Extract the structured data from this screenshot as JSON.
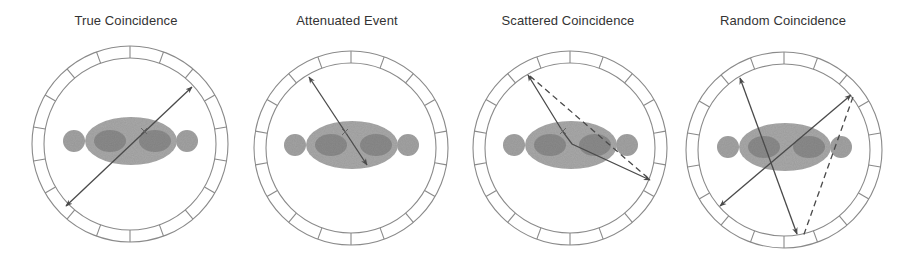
{
  "figure": {
    "colors": {
      "ring": "#8a8a8a",
      "line": "#4a4a4a",
      "torso": "#a9a9a9",
      "organ": "#8b8b8b",
      "arm": "#a3a3a3",
      "title": "#333333"
    },
    "ring_segments": 18,
    "panels": [
      {
        "title": "True Coincidence",
        "title_x": 126,
        "cx": 130,
        "cy": 144,
        "r_outer": 98,
        "r_inner": 86,
        "solid_lines": [
          {
            "x1": 66,
            "y1": 206,
            "x2": 192,
            "y2": 87,
            "start_arrow": true,
            "end_arrow": true
          }
        ],
        "paths": [],
        "dashed_lines": [],
        "emission_points": [
          {
            "x": 144,
            "y": 131
          }
        ]
      },
      {
        "title": "Attenuated Event",
        "title_x": 347,
        "cx": 351,
        "cy": 148,
        "r_outer": 97,
        "r_inner": 85,
        "solid_lines": [
          {
            "x1": 309,
            "y1": 77,
            "x2": 367,
            "y2": 165,
            "start_arrow": true,
            "end_arrow": true
          }
        ],
        "paths": [],
        "dashed_lines": [],
        "emission_points": [
          {
            "x": 345,
            "y": 132
          }
        ]
      },
      {
        "title": "Scattered Coincidence",
        "title_x": 568,
        "cx": 570,
        "cy": 148,
        "r_outer": 97,
        "r_inner": 85,
        "solid_lines": [],
        "paths": [
          {
            "points": [
              [
                528,
                75
              ],
              [
                563,
                132
              ],
              [
                572,
                144
              ],
              [
                650,
                180
              ]
            ],
            "start_arrow": true,
            "end_arrow": true
          }
        ],
        "dashed_lines": [
          {
            "x1": 530,
            "y1": 76,
            "x2": 648,
            "y2": 178
          }
        ],
        "emission_points": [
          {
            "x": 563,
            "y": 131
          }
        ]
      },
      {
        "title": "Random Coincidence",
        "title_x": 783,
        "cx": 784,
        "cy": 150,
        "r_outer": 98,
        "r_inner": 86,
        "solid_lines": [
          {
            "x1": 740,
            "y1": 78,
            "x2": 797,
            "y2": 234,
            "start_arrow": true,
            "end_arrow": true
          },
          {
            "x1": 851,
            "y1": 95,
            "x2": 720,
            "y2": 206,
            "start_arrow": true,
            "end_arrow": true
          }
        ],
        "paths": [],
        "dashed_lines": [
          {
            "x1": 853,
            "y1": 97,
            "x2": 803,
            "y2": 237
          }
        ],
        "emission_points": []
      }
    ]
  }
}
